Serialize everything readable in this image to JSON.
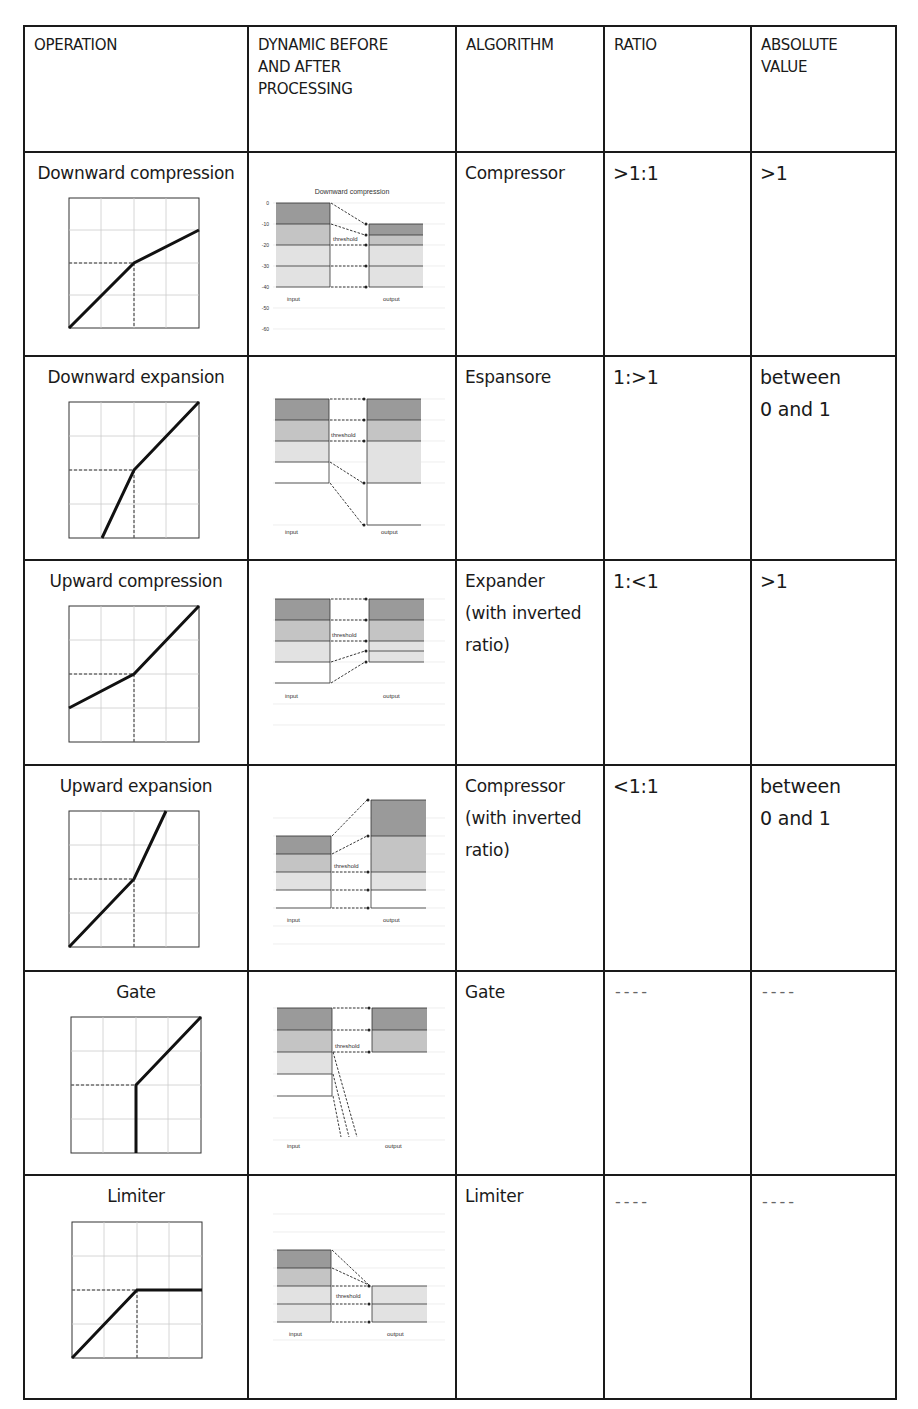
{
  "table": {
    "headers": {
      "operation": "OPERATION",
      "dynamic": [
        "DYNAMIC BEFORE",
        "AND AFTER",
        "PROCESSING"
      ],
      "algorithm": "ALGORITHM",
      "ratio": "RATIO",
      "absolute": [
        "ABSOLUTE",
        "VALUE"
      ]
    },
    "rows": [
      {
        "operation": "Downward compression",
        "diagram_title": "Downward compression",
        "algorithm": [
          "Compressor"
        ],
        "ratio": ">1:1",
        "absolute": [
          ">1"
        ]
      },
      {
        "operation": "Downward expansion",
        "algorithm": [
          "Espansore"
        ],
        "ratio": "1:>1",
        "absolute": [
          "between",
          "0 and 1"
        ]
      },
      {
        "operation": "Upward compression",
        "algorithm": [
          "Expander",
          "(with inverted",
          "ratio)"
        ],
        "ratio": "1:<1",
        "absolute": [
          ">1"
        ]
      },
      {
        "operation": "Upward expansion",
        "algorithm": [
          "Compressor",
          "(with inverted",
          "ratio)"
        ],
        "ratio": "<1:1",
        "absolute": [
          "between",
          "0 and 1"
        ]
      },
      {
        "operation": "Gate",
        "algorithm": [
          "Gate"
        ],
        "ratio": "----",
        "absolute": [
          "----"
        ]
      },
      {
        "operation": "Limiter",
        "algorithm": [
          "Limiter"
        ],
        "ratio": "----",
        "absolute": [
          "----"
        ]
      }
    ]
  },
  "diagram_labels": {
    "input": "input",
    "output": "output",
    "threshold": "threshold",
    "db_ticks": [
      "0",
      "-10",
      "-20",
      "-30",
      "-40",
      "-50",
      "-60"
    ]
  },
  "colors": {
    "border": "#1a1a1a",
    "band_dark": "#9a9a9a",
    "band_mid": "#c4c4c4",
    "band_light": "#e2e2e2",
    "grid": "#cccccc"
  }
}
